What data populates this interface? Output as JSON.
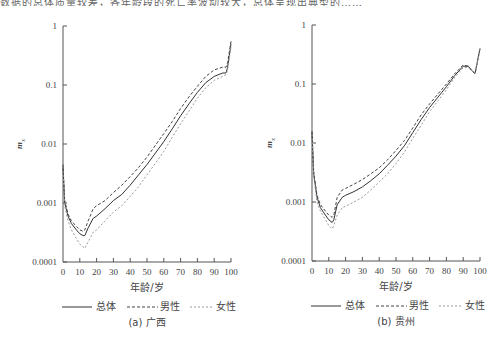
{
  "header_text": "数据的总体质量较差，各年龄段的死亡率波动较大，总体呈现出典型的……",
  "chart_data": [
    {
      "type": "line",
      "title": "(a) 广西",
      "xlabel": "年龄/岁",
      "ylabel": "m_x",
      "yscale": "log",
      "ylim": [
        0.0001,
        1
      ],
      "xlim": [
        0,
        100
      ],
      "x_ticks": [
        "0",
        "10",
        "20",
        "30",
        "40",
        "50",
        "60",
        "70",
        "80",
        "90",
        "100"
      ],
      "y_ticks": [
        "1",
        "0.1",
        "0.01",
        "0.001",
        "0.0001"
      ],
      "legend": [
        "总体",
        "男性",
        "女性"
      ],
      "legend_position": "bottom",
      "grid": false,
      "x": [
        0,
        1,
        3,
        5,
        8,
        10,
        12,
        13,
        15,
        18,
        20,
        25,
        30,
        35,
        40,
        45,
        50,
        55,
        60,
        65,
        70,
        75,
        80,
        85,
        90,
        95,
        97,
        98,
        100
      ],
      "series": [
        {
          "name": "总体",
          "style": "solid",
          "values": [
            0.004,
            0.001,
            0.0006,
            0.00045,
            0.00035,
            0.0003,
            0.00028,
            0.00028,
            0.00038,
            0.00055,
            0.0006,
            0.0008,
            0.0011,
            0.0014,
            0.002,
            0.003,
            0.0045,
            0.007,
            0.011,
            0.018,
            0.03,
            0.048,
            0.075,
            0.11,
            0.14,
            0.16,
            0.16,
            0.2,
            0.5
          ]
        },
        {
          "name": "男性",
          "style": "dashed",
          "values": [
            0.0045,
            0.0011,
            0.00065,
            0.0005,
            0.0004,
            0.00035,
            0.00033,
            0.00035,
            0.0005,
            0.0008,
            0.0009,
            0.0011,
            0.0015,
            0.002,
            0.0028,
            0.004,
            0.006,
            0.0095,
            0.015,
            0.024,
            0.04,
            0.063,
            0.095,
            0.14,
            0.18,
            0.2,
            0.2,
            0.24,
            0.55
          ]
        },
        {
          "name": "女性",
          "style": "dotted",
          "values": [
            0.0035,
            0.0009,
            0.0005,
            0.00035,
            0.00025,
            0.0002,
            0.00018,
            0.00017,
            0.00022,
            0.00032,
            0.00035,
            0.0005,
            0.0007,
            0.0009,
            0.0013,
            0.0019,
            0.003,
            0.0047,
            0.0075,
            0.013,
            0.022,
            0.036,
            0.06,
            0.09,
            0.12,
            0.14,
            0.15,
            0.18,
            0.45
          ]
        }
      ]
    },
    {
      "type": "line",
      "title": "(b) 贵州",
      "xlabel": "年龄/岁",
      "ylabel": "m_x",
      "yscale": "log",
      "ylim": [
        0.0001,
        1
      ],
      "xlim": [
        0,
        100
      ],
      "x_ticks": [
        "0",
        "10",
        "20",
        "30",
        "40",
        "50",
        "60",
        "70",
        "80",
        "90",
        "100"
      ],
      "y_ticks": [
        "1",
        "0.1",
        "0.01",
        "0.001",
        "0.0001"
      ],
      "legend": [
        "总体",
        "男性",
        "女性"
      ],
      "legend_position": "bottom",
      "grid": false,
      "x": [
        0,
        1,
        3,
        5,
        8,
        10,
        12,
        13,
        15,
        18,
        20,
        25,
        30,
        35,
        40,
        45,
        50,
        55,
        60,
        65,
        70,
        75,
        80,
        85,
        90,
        93,
        95,
        97,
        100
      ],
      "series": [
        {
          "name": "总体",
          "style": "solid",
          "values": [
            0.015,
            0.003,
            0.0012,
            0.0008,
            0.0006,
            0.0005,
            0.00045,
            0.0005,
            0.0009,
            0.0012,
            0.0013,
            0.0015,
            0.0018,
            0.0023,
            0.003,
            0.0042,
            0.006,
            0.009,
            0.015,
            0.025,
            0.04,
            0.06,
            0.09,
            0.14,
            0.2,
            0.2,
            0.17,
            0.15,
            0.4
          ]
        },
        {
          "name": "男性",
          "style": "dashed",
          "values": [
            0.016,
            0.0032,
            0.0013,
            0.0009,
            0.0007,
            0.0006,
            0.00055,
            0.0006,
            0.0012,
            0.0016,
            0.0017,
            0.002,
            0.0024,
            0.003,
            0.0038,
            0.0052,
            0.0075,
            0.011,
            0.018,
            0.03,
            0.046,
            0.068,
            0.1,
            0.15,
            0.21,
            0.2,
            0.17,
            0.15,
            0.4
          ]
        },
        {
          "name": "女性",
          "style": "dotted",
          "values": [
            0.014,
            0.0028,
            0.001,
            0.0007,
            0.0005,
            0.0004,
            0.00035,
            0.0004,
            0.0006,
            0.0008,
            0.00085,
            0.001,
            0.0012,
            0.0016,
            0.0022,
            0.003,
            0.0045,
            0.007,
            0.012,
            0.02,
            0.034,
            0.052,
            0.08,
            0.13,
            0.19,
            0.19,
            0.17,
            0.15,
            0.4
          ]
        }
      ]
    }
  ],
  "charts": [
    {
      "caption": "(a) 广西",
      "xlabel": "年龄/岁",
      "ylabel": "m",
      "ylabel_sub": "x",
      "legend_total": "总体",
      "legend_male": "男性",
      "legend_female": "女性"
    },
    {
      "caption": "(b) 贵州",
      "xlabel": "年龄/岁",
      "ylabel": "m",
      "ylabel_sub": "x",
      "legend_total": "总体",
      "legend_male": "男性",
      "legend_female": "女性"
    }
  ],
  "colors": {
    "axis": "#555555",
    "total": "#333333",
    "male": "#444444",
    "female": "#999999"
  }
}
